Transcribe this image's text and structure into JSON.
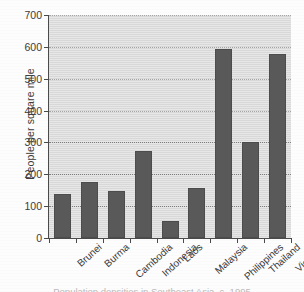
{
  "chart_data": {
    "type": "bar",
    "title": "",
    "subtitle": "",
    "xlabel": "",
    "ylabel": "People per square mile",
    "categories": [
      "Brunei",
      "Burma",
      "Cambodia",
      "Indonesia",
      "Laos",
      "Malaysia",
      "Philippines",
      "Thailand",
      "Vietnam"
    ],
    "values": [
      138,
      175,
      148,
      272,
      52,
      157,
      594,
      302,
      578
    ],
    "ylim": [
      0,
      700
    ],
    "ytick_labels": [
      "0",
      "100",
      "200",
      "300",
      "400",
      "500",
      "600",
      "700"
    ],
    "ytick_values": [
      0,
      100,
      200,
      300,
      400,
      500,
      600,
      700
    ],
    "grid": true,
    "grid_style": "dotted-horizontal",
    "legend": "none",
    "bar_color": "#595959",
    "plot_background": "#dcdcdc",
    "axis_color": "#4a4a4a",
    "gridline_color": "#7e7e7e"
  },
  "caption": {
    "text": "Population densities in Southeast Asia, c. 1995"
  }
}
